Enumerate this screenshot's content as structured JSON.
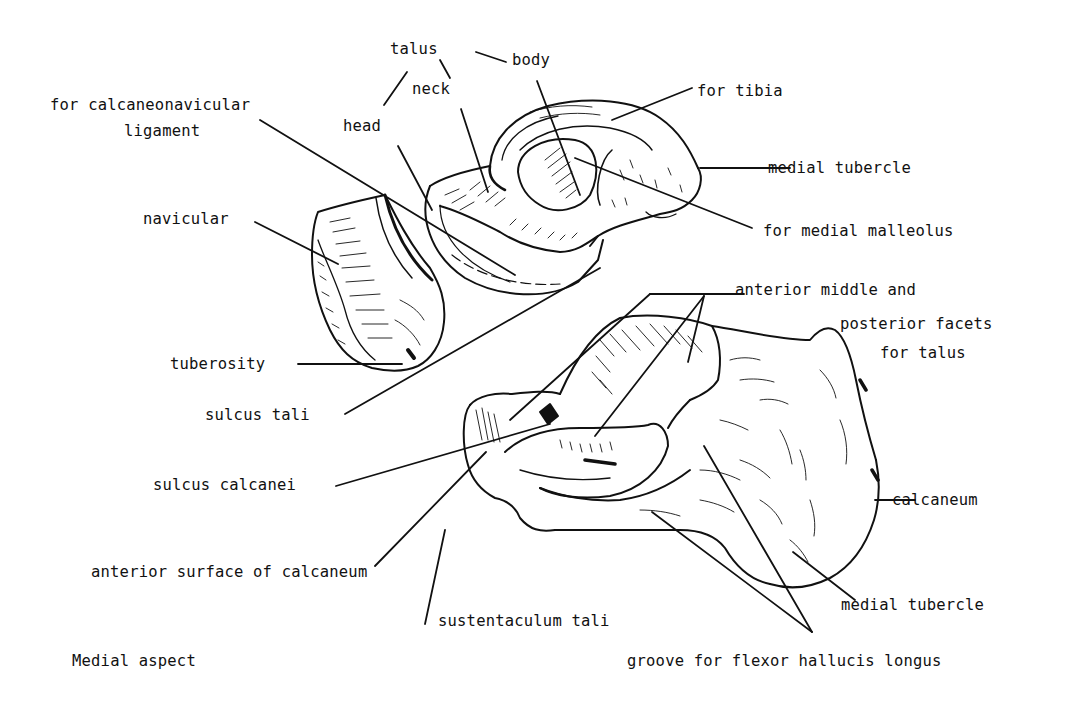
{
  "figure": {
    "caption": "Medial aspect",
    "bones": [
      "talus",
      "navicular",
      "calcaneum"
    ]
  },
  "labels": {
    "talus": "talus",
    "body": "body",
    "neck": "neck",
    "head": "head",
    "for_tibia": "for tibia",
    "calcaneonavicular_1": "for calcaneonavicular",
    "calcaneonavicular_2": "ligament",
    "medial_tubercle_talus": "medial tubercle",
    "for_medial_malleolus": "for medial malleolus",
    "navicular": "navicular",
    "tuberosity": "tuberosity",
    "facets_1": "anterior middle and",
    "facets_2": "posterior facets",
    "facets_3": "for talus",
    "sulcus_tali": "sulcus tali",
    "sulcus_calcanei": "sulcus calcanei",
    "calcaneum": "calcaneum",
    "anterior_surface": "anterior surface of calcaneum",
    "medial_tubercle_calcaneum": "medial tubercle",
    "sustentaculum_tali": "sustentaculum tali",
    "groove_fhl": "groove for flexor hallucis longus",
    "caption": "Medial aspect"
  }
}
